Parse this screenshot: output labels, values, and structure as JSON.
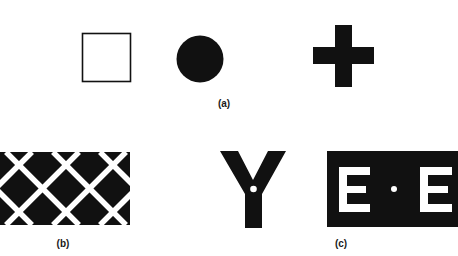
{
  "figure": {
    "panel_a": {
      "label": "(a)",
      "shapes": [
        "outlined-square",
        "filled-circle",
        "filled-cross"
      ]
    },
    "panel_b": {
      "label": "(b)",
      "shapes": [
        "black-lattice-with-white-diagonal-grid"
      ]
    },
    "panel_c": {
      "label": "(c)",
      "letter_y": "Y",
      "letter_e_left": "E",
      "letter_e_right": "E",
      "shapes": [
        "letter-Y-with-white-dot",
        "black-box-E-dot-E"
      ]
    }
  },
  "colors": {
    "ink": "#111111",
    "paper": "#ffffff"
  }
}
